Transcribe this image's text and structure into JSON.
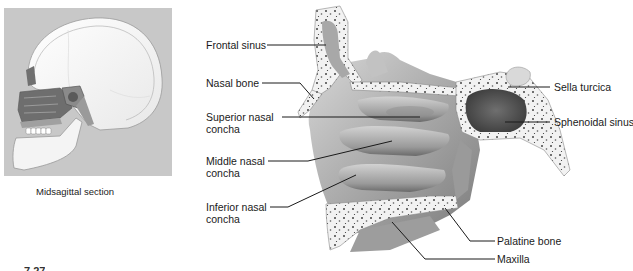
{
  "inset": {
    "caption": "Midsagittal section",
    "background_color": "#c8c8c8"
  },
  "figure_number": "7.27",
  "labels": {
    "frontal_sinus": {
      "line1": "Frontal sinus",
      "line2": ""
    },
    "nasal_bone": {
      "line1": "Nasal bone",
      "line2": ""
    },
    "superior_nasal_concha": {
      "line1": "Superior nasal",
      "line2": "concha"
    },
    "middle_nasal_concha": {
      "line1": "Middle nasal",
      "line2": "concha"
    },
    "inferior_nasal_concha": {
      "line1": "Inferior nasal",
      "line2": "concha"
    },
    "sella_turcica": {
      "line1": "Sella turcica",
      "line2": ""
    },
    "sphenoidal_sinus": {
      "line1": "Sphenoidal sinus",
      "line2": ""
    },
    "palatine_bone": {
      "line1": "Palatine bone",
      "line2": ""
    },
    "maxilla": {
      "line1": "Maxilla",
      "line2": ""
    }
  }
}
